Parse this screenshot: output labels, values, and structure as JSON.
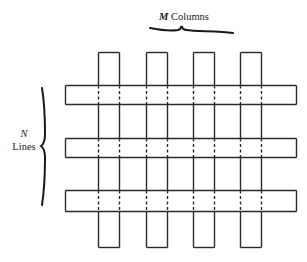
{
  "diagram": {
    "columns_label": {
      "variable": "M",
      "text": " Columns"
    },
    "lines_label": {
      "variable": "N",
      "text": "Lines"
    },
    "columns": [
      {
        "x": 98,
        "width": 21,
        "top": 52,
        "bottom": 247
      },
      {
        "x": 146,
        "width": 21,
        "top": 52,
        "bottom": 247
      },
      {
        "x": 193,
        "width": 21,
        "top": 52,
        "bottom": 247
      },
      {
        "x": 240,
        "width": 21,
        "top": 52,
        "bottom": 247
      }
    ],
    "lines": [
      {
        "y": 85,
        "height": 19,
        "left": 65,
        "right": 296
      },
      {
        "y": 138,
        "height": 19,
        "left": 65,
        "right": 296
      },
      {
        "y": 190,
        "height": 21,
        "left": 65,
        "right": 296
      }
    ],
    "stroke_color": "#2a2a2a",
    "hidden_edge_style": "dashed"
  }
}
